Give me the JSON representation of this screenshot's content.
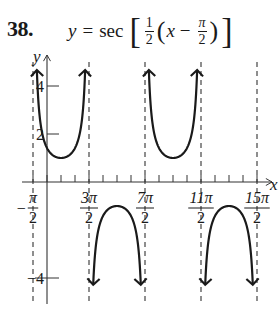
{
  "problem": {
    "number": "38.",
    "equation": {
      "lhs": "y",
      "equals": "=",
      "func": "sec",
      "frac_num": "1",
      "frac_den": "2",
      "var": "x",
      "minus": "−",
      "pi_num": "π",
      "pi_den": "2"
    }
  },
  "chart_data": {
    "type": "line",
    "xlabel": "x",
    "ylabel": "y",
    "x_tick_labels": [
      "−π/2",
      "3π/2",
      "7π/2",
      "11π/2",
      "15π/2"
    ],
    "x_tick_values": [
      -1.5708,
      4.7124,
      10.9956,
      17.2788,
      23.5619
    ],
    "x_minor_tick_step": "π/2",
    "y_tick_labels": [
      "4",
      "2",
      "−4"
    ],
    "y_tick_values": [
      4,
      2,
      -4
    ],
    "vertical_asymptotes": [
      "−π/2",
      "3π/2",
      "7π/2",
      "11π/2",
      "15π/2"
    ],
    "branches": [
      {
        "direction": "up",
        "interval": [
          "−π/2",
          "3π/2"
        ],
        "vertex": {
          "x": "π/2",
          "y": 1
        }
      },
      {
        "direction": "down",
        "interval": [
          "3π/2",
          "7π/2"
        ],
        "vertex": {
          "x": "5π/2",
          "y": -1
        }
      },
      {
        "direction": "up",
        "interval": [
          "7π/2",
          "11π/2"
        ],
        "vertex": {
          "x": "9π/2",
          "y": 1
        }
      },
      {
        "direction": "down",
        "interval": [
          "11π/2",
          "15π/2"
        ],
        "vertex": {
          "x": "13π/2",
          "y": -1
        }
      }
    ],
    "xlim": [
      "−π/2",
      "15π/2"
    ],
    "ylim": [
      -4.5,
      5
    ],
    "grid": false,
    "legend": null
  },
  "colors": {
    "curve": "#1a1a1a",
    "axis": "#333333",
    "asymptote": "#444444"
  }
}
